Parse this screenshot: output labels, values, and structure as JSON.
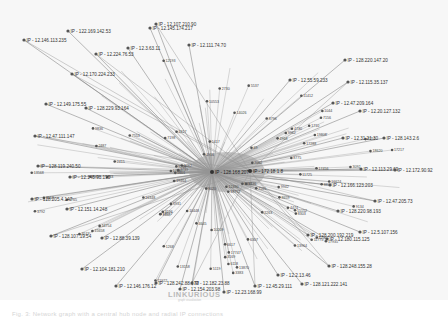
{
  "graph": {
    "hub": {
      "label": "IP - 128.168.207",
      "x": 212,
      "y": 172
    },
    "hub2": {
      "label": "IP - 172.18.1.8",
      "x": 250,
      "y": 171
    },
    "colors": {
      "edge": "#8a8a8a",
      "node": "#555555",
      "hub_fill": "#9c9c9c",
      "background": "#f7f7f7"
    },
    "nodes": [
      {
        "label": "IP - 12.107.210.90",
        "x": 156,
        "y": 24
      },
      {
        "label": "IP - 12.145.174.217",
        "x": 150,
        "y": 28
      },
      {
        "label": "IP - 122.169.142.53",
        "x": 68,
        "y": 31
      },
      {
        "label": "IP - 12.146.113.235",
        "x": 24,
        "y": 40
      },
      {
        "label": "IP - 12.3.63.11",
        "x": 128,
        "y": 48
      },
      {
        "label": "IP - 12.111.74.70",
        "x": 189,
        "y": 45
      },
      {
        "label": "IP - 12.224.76.53",
        "x": 96,
        "y": 54
      },
      {
        "label": "IP - 128.220.147.20",
        "x": 345,
        "y": 60
      },
      {
        "label": "IP - 12.55.59.233",
        "x": 290,
        "y": 80
      },
      {
        "label": "IP - 12.115.35.137",
        "x": 348,
        "y": 82
      },
      {
        "label": "IP - 12.47.209.164",
        "x": 333,
        "y": 103
      },
      {
        "label": "IP - 12.20.127.132",
        "x": 360,
        "y": 111
      },
      {
        "label": "IP - 12.170.224.233",
        "x": 72,
        "y": 74
      },
      {
        "label": "IP - 12.149.175.55",
        "x": 46,
        "y": 104
      },
      {
        "label": "IP - 128.229.93.164",
        "x": 86,
        "y": 108
      },
      {
        "label": "IP - 12.47.111.147",
        "x": 35,
        "y": 136
      },
      {
        "label": "IP - 12.31.21.30",
        "x": 343,
        "y": 138
      },
      {
        "label": "IP - 128.143.2.6",
        "x": 384,
        "y": 138
      },
      {
        "label": "IP - 128.119.240.50",
        "x": 38,
        "y": 166
      },
      {
        "label": "IP - 12.145.93.195",
        "x": 70,
        "y": 177
      },
      {
        "label": "IP - 128.205.4.147",
        "x": 32,
        "y": 199
      },
      {
        "label": "IP - 12.113.29.69",
        "x": 361,
        "y": 169
      },
      {
        "label": "IP - 12.172.90.92",
        "x": 395,
        "y": 170
      },
      {
        "label": "IP - 12.166.123.203",
        "x": 330,
        "y": 185
      },
      {
        "label": "IP - 12.47.205.73",
        "x": 375,
        "y": 201
      },
      {
        "label": "IP - 128.220.98.193",
        "x": 338,
        "y": 211
      },
      {
        "label": "IP - 12.151.14.248",
        "x": 67,
        "y": 209
      },
      {
        "label": "IP - 128.107.19.54",
        "x": 51,
        "y": 236
      },
      {
        "label": "IP - 12.88.39.139",
        "x": 102,
        "y": 238
      },
      {
        "label": "IP - 12.5.107.156",
        "x": 360,
        "y": 232
      },
      {
        "label": "IP - 128.200.192.219",
        "x": 308,
        "y": 235
      },
      {
        "label": "IP - 12.180.115.125",
        "x": 327,
        "y": 239
      },
      {
        "label": "IP - 12.104.181.210",
        "x": 82,
        "y": 269
      },
      {
        "label": "IP - 128.248.155.28",
        "x": 329,
        "y": 266
      },
      {
        "label": "IP - 12.146.176.12",
        "x": 116,
        "y": 286
      },
      {
        "label": "IP - 128.242.88.173",
        "x": 156,
        "y": 283
      },
      {
        "label": "IP - 12.182.23.88",
        "x": 192,
        "y": 283
      },
      {
        "label": "IP - 12.154.203.98",
        "x": 180,
        "y": 289
      },
      {
        "label": "IP - 12.23.168.99",
        "x": 224,
        "y": 292
      },
      {
        "label": "IP - 12.45.29.111",
        "x": 255,
        "y": 286
      },
      {
        "label": "IP - 12.2.13.46",
        "x": 278,
        "y": 275
      },
      {
        "label": "IP - 128.121.222.141",
        "x": 302,
        "y": 284
      }
    ]
  },
  "watermark": {
    "text": "LINKURIOUS",
    "subtext": "graph visualization"
  },
  "caption": {
    "text": "Fig. 3: Network graph with a central hub node and radial IP connections"
  }
}
